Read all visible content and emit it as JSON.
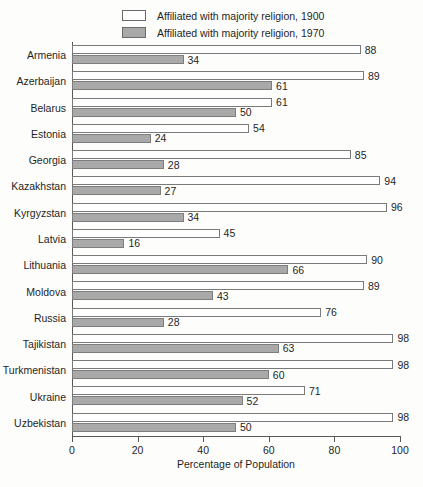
{
  "chart_data": {
    "type": "bar",
    "orientation": "horizontal",
    "title": "",
    "xlabel": "Percentage of Population",
    "ylabel": "",
    "xlim": [
      0,
      100
    ],
    "xticks": [
      0,
      20,
      40,
      60,
      80,
      100
    ],
    "grid": false,
    "legend_position": "top",
    "categories": [
      "Armenia",
      "Azerbaijan",
      "Belarus",
      "Estonia",
      "Georgia",
      "Kazakhstan",
      "Kyrgyzstan",
      "Latvia",
      "Lithuania",
      "Moldova",
      "Russia",
      "Tajikistan",
      "Turkmenistan",
      "Ukraine",
      "Uzbekistan"
    ],
    "series": [
      {
        "name": "Affiliated with majority religion, 1900",
        "color": "#ffffff",
        "values": [
          88,
          89,
          61,
          54,
          85,
          94,
          96,
          45,
          90,
          89,
          76,
          98,
          98,
          71,
          98
        ]
      },
      {
        "name": "Affiliated with majority religion, 1970",
        "color": "#a9a9a9",
        "values": [
          34,
          61,
          50,
          24,
          28,
          27,
          34,
          16,
          66,
          43,
          28,
          63,
          60,
          52,
          50
        ]
      }
    ]
  },
  "legend": {
    "items": [
      {
        "label": "Affiliated with majority religion, 1900",
        "swatch": "s1900"
      },
      {
        "label": "Affiliated with majority religion, 1970",
        "swatch": "s1970"
      }
    ]
  },
  "axis": {
    "x_title": "Percentage of Population",
    "tick_labels": [
      "0",
      "20",
      "40",
      "60",
      "80",
      "100"
    ]
  }
}
